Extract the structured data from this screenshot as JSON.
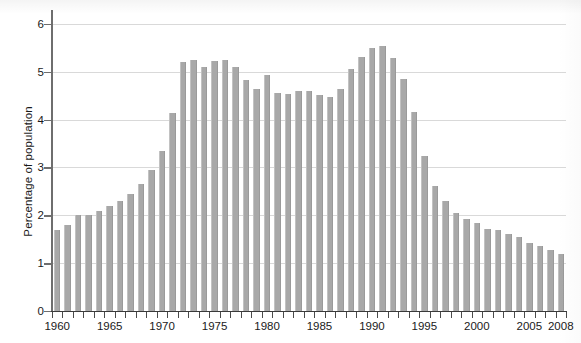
{
  "chart_data": {
    "type": "bar",
    "title": "",
    "xlabel": "",
    "ylabel": "Percentage of population",
    "ylim": [
      0,
      6.25
    ],
    "yticks": [
      0,
      1,
      2,
      3,
      4,
      5,
      6
    ],
    "ytick_labels": [
      "0",
      "1",
      "2",
      "3",
      "4",
      "5",
      "6"
    ],
    "xlim": [
      1959.5,
      2008.5
    ],
    "xtick_labels": [
      "1960",
      "1965",
      "1970",
      "1975",
      "1980",
      "1985",
      "1990",
      "1995",
      "2000",
      "2005",
      "2008"
    ],
    "xtick_values": [
      1960,
      1965,
      1970,
      1975,
      1980,
      1985,
      1990,
      1995,
      2000,
      2005,
      2008
    ],
    "grid": "horizontal",
    "legend": "none",
    "bar_color": "#a8a8a8",
    "categories": [
      "1960",
      "1961",
      "1962",
      "1963",
      "1964",
      "1965",
      "1966",
      "1967",
      "1968",
      "1969",
      "1970",
      "1971",
      "1972",
      "1973",
      "1974",
      "1975",
      "1976",
      "1977",
      "1978",
      "1979",
      "1980",
      "1981",
      "1982",
      "1983",
      "1984",
      "1985",
      "1986",
      "1987",
      "1988",
      "1989",
      "1990",
      "1991",
      "1992",
      "1993",
      "1994",
      "1995",
      "1996",
      "1997",
      "1998",
      "1999",
      "2000",
      "2001",
      "2002",
      "2003",
      "2004",
      "2005",
      "2006",
      "2007",
      "2008"
    ],
    "values": [
      1.7,
      1.8,
      2.0,
      2.0,
      2.1,
      2.2,
      2.3,
      2.45,
      2.65,
      2.95,
      3.35,
      4.13,
      5.2,
      5.25,
      5.1,
      5.22,
      5.25,
      5.1,
      4.82,
      4.65,
      4.93,
      4.55,
      4.53,
      4.6,
      4.6,
      4.52,
      4.47,
      4.65,
      5.05,
      5.3,
      5.5,
      5.55,
      5.28,
      4.85,
      4.15,
      3.25,
      2.62,
      2.3,
      2.05,
      1.92,
      1.83,
      1.72,
      1.7,
      1.6,
      1.55,
      1.42,
      1.35,
      1.28,
      1.2
    ]
  }
}
